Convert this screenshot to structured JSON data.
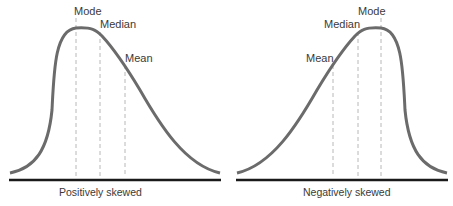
{
  "panels": [
    {
      "caption": "Positively skewed",
      "labels": {
        "mode": "Mode",
        "median": "Median",
        "mean": "Mean"
      }
    },
    {
      "caption": "Negatively skewed",
      "labels": {
        "mode": "Mode",
        "median": "Median",
        "mean": "Mean"
      }
    }
  ],
  "colors": {
    "curve": "#6b6b6b",
    "baseline": "#1a1a1a",
    "dashed": "#b0b0b0",
    "text": "#3a3a3a"
  }
}
